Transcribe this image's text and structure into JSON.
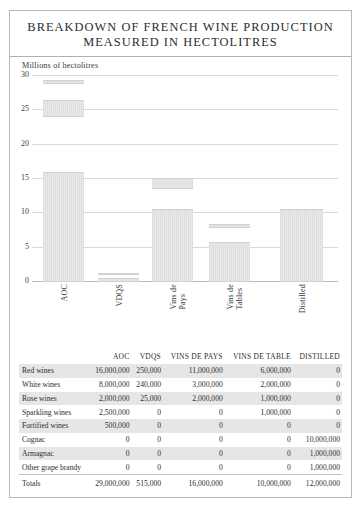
{
  "title": {
    "line1": "BREAKDOWN OF FRENCH WINE PRODUCTION",
    "line2": "MEASURED IN HECTOLITRES"
  },
  "chart_data": {
    "type": "bar",
    "title": "BREAKDOWN OF FRENCH WINE PRODUCTION MEASURED IN HECTOLITRES",
    "subtitle": "",
    "xlabel": "",
    "ylabel": "Millions of hectolitres",
    "ylim": [
      0,
      30
    ],
    "yticks": [
      0,
      5,
      10,
      15,
      20,
      25,
      30
    ],
    "ytick_labels": [
      "0",
      "5",
      "10",
      "15",
      "20",
      "25",
      "30"
    ],
    "grid": true,
    "legend": false,
    "stacked": true,
    "units": "millions of hectolitres",
    "categories": [
      "AOC",
      "VDQS",
      "Vins de Pays",
      "Vins de Tables",
      "Distilled"
    ],
    "category_labels": [
      "AOC",
      "VDQS",
      "Vins de\nPays",
      "Vins de\nTables",
      "Distilled"
    ],
    "series": [
      {
        "name": "Red wines",
        "values": [
          16.0,
          0.25,
          11.0,
          6.0,
          0.0
        ]
      },
      {
        "name": "White wines",
        "values": [
          8.0,
          0.24,
          3.0,
          2.0,
          0.0
        ]
      },
      {
        "name": "Rose wines",
        "values": [
          2.0,
          0.025,
          2.0,
          1.0,
          0.0
        ]
      },
      {
        "name": "Sparkling wines",
        "values": [
          2.5,
          0.0,
          0.0,
          1.0,
          0.0
        ]
      },
      {
        "name": "Fortified wines",
        "values": [
          0.5,
          0.0,
          0.0,
          0.0,
          0.0
        ]
      },
      {
        "name": "Cognac",
        "values": [
          0.0,
          0.0,
          0.0,
          0.0,
          10.0
        ]
      },
      {
        "name": "Armagnac",
        "values": [
          0.0,
          0.0,
          0.0,
          0.0,
          1.0
        ]
      },
      {
        "name": "Other grape brandy",
        "values": [
          0.0,
          0.0,
          0.0,
          0.0,
          1.0
        ]
      }
    ],
    "totals": [
      29.0,
      0.515,
      16.0,
      10.0,
      12.0
    ],
    "bars": [
      {
        "category": "AOC",
        "left_pct": 3.6,
        "width_pct": 13.4,
        "segments": [
          {
            "from": 0.0,
            "to": 16.0
          },
          {
            "from": 24.0,
            "to": 26.5
          },
          {
            "from": 28.8,
            "to": 29.4
          }
        ]
      },
      {
        "category": "VDQS",
        "left_pct": 21.6,
        "width_pct": 13.4,
        "segments": [
          {
            "from": 0.0,
            "to": 0.55
          },
          {
            "from": 1.0,
            "to": 1.3
          }
        ]
      },
      {
        "category": "Vins de Pays",
        "left_pct": 39.2,
        "width_pct": 13.4,
        "segments": [
          {
            "from": 0.0,
            "to": 10.6
          },
          {
            "from": 13.6,
            "to": 15.2
          }
        ]
      },
      {
        "category": "Vins de Tables",
        "left_pct": 57.8,
        "width_pct": 13.4,
        "segments": [
          {
            "from": 0.0,
            "to": 5.8
          },
          {
            "from": 7.9,
            "to": 8.5
          }
        ]
      },
      {
        "category": "Distilled",
        "left_pct": 81.0,
        "width_pct": 14.0,
        "segments": [
          {
            "from": 0.0,
            "to": 10.7
          }
        ]
      }
    ]
  },
  "table": {
    "columns": [
      "",
      "AOC",
      "VDQS",
      "VINS DE PAYS",
      "VINS DE TABLE",
      "DISTILLED"
    ],
    "rows": [
      {
        "label": "Red wines",
        "cells": [
          "16,000,000",
          "250,000",
          "11,000,000",
          "6,000,000",
          "0"
        ],
        "shaded": true
      },
      {
        "label": "White wines",
        "cells": [
          "8,000,000",
          "240,000",
          "3,000,000",
          "2,000,000",
          "0"
        ],
        "shaded": false
      },
      {
        "label": "Rose wines",
        "cells": [
          "2,000,000",
          "25,000",
          "2,000,000",
          "1,000,000",
          "0"
        ],
        "shaded": true
      },
      {
        "label": "Sparkling wines",
        "cells": [
          "2,500,000",
          "0",
          "0",
          "1,000,000",
          "0"
        ],
        "shaded": false
      },
      {
        "label": "Fortified wines",
        "cells": [
          "500,000",
          "0",
          "0",
          "0",
          "0"
        ],
        "shaded": true
      },
      {
        "label": "Cognac",
        "cells": [
          "0",
          "0",
          "0",
          "0",
          "10,000,000"
        ],
        "shaded": false
      },
      {
        "label": "Armagnac",
        "cells": [
          "0",
          "0",
          "0",
          "0",
          "1,000,000"
        ],
        "shaded": true
      },
      {
        "label": "Other grape brandy",
        "cells": [
          "0",
          "0",
          "0",
          "0",
          "1,000,000"
        ],
        "shaded": false
      }
    ],
    "totals": {
      "label": "Totals",
      "cells": [
        "29,000,000",
        "515,000",
        "16,000,000",
        "10,000,000",
        "12,000,000"
      ]
    }
  },
  "colors": {
    "bar_fill": "#e2e2e2",
    "grid": "#d9d9d9",
    "border": "#b9b9b9",
    "row_shade": "#e6e6e6",
    "text": "#2d2d2d"
  }
}
